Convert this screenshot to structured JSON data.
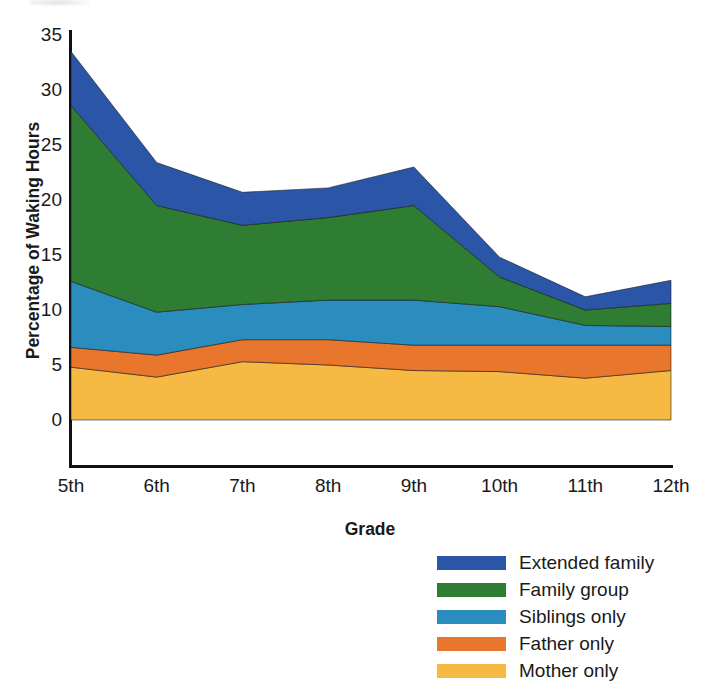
{
  "chart_data": {
    "type": "area",
    "stacked": true,
    "title": "",
    "xlabel": "Grade",
    "ylabel": "Percentage of Waking Hours",
    "categories": [
      "5th",
      "6th",
      "7th",
      "8th",
      "9th",
      "10th",
      "11th",
      "12th"
    ],
    "ylim": [
      0,
      35
    ],
    "yticks": [
      0,
      5,
      10,
      15,
      20,
      25,
      30,
      35
    ],
    "ytick_labels": [
      "0",
      "5",
      "10",
      "15",
      "20",
      "25",
      "30",
      "35"
    ],
    "grid": false,
    "legend_position": "bottom-right",
    "series": [
      {
        "name": "Mother only",
        "color": "#F5B944",
        "values": [
          4.8,
          3.9,
          5.3,
          5.0,
          4.5,
          4.4,
          3.8,
          4.5
        ]
      },
      {
        "name": "Father only",
        "color": "#E8762C",
        "values": [
          1.8,
          2.0,
          2.0,
          2.3,
          2.3,
          2.4,
          3.0,
          2.3
        ]
      },
      {
        "name": "Siblings only",
        "color": "#2B8CBE",
        "values": [
          6.0,
          3.9,
          3.2,
          3.6,
          4.1,
          3.5,
          1.8,
          1.7
        ]
      },
      {
        "name": "Family group",
        "color": "#2E7D32",
        "values": [
          16.0,
          9.7,
          7.2,
          7.5,
          8.6,
          2.7,
          1.4,
          2.1
        ]
      },
      {
        "name": "Extended family",
        "color": "#2B56A8",
        "values": [
          4.9,
          3.9,
          3.0,
          2.7,
          3.5,
          1.8,
          1.2,
          2.1
        ]
      }
    ],
    "stack_order_bottom_to_top": [
      "Mother only",
      "Father only",
      "Siblings only",
      "Family group",
      "Extended family"
    ],
    "stack_totals": [
      33.5,
      23.4,
      20.7,
      21.1,
      23.0,
      14.8,
      11.2,
      12.7
    ]
  },
  "legend": {
    "items": [
      {
        "label": "Extended family",
        "color": "#2B56A8"
      },
      {
        "label": "Family group",
        "color": "#2E7D32"
      },
      {
        "label": "Siblings only",
        "color": "#2B8CBE"
      },
      {
        "label": "Father only",
        "color": "#E8762C"
      },
      {
        "label": "Mother only",
        "color": "#F5B944"
      }
    ]
  },
  "axes": {
    "y_title": "Percentage of Waking Hours",
    "x_title": "Grade"
  }
}
